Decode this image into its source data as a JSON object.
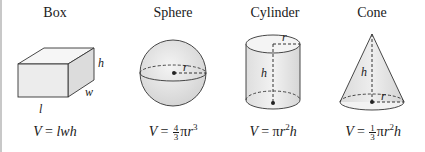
{
  "figure": {
    "shapes": [
      {
        "id": "box",
        "title": "Box",
        "labels": {
          "height": "h",
          "width": "w",
          "length": "l"
        },
        "formula": {
          "lhs": "V",
          "eq": "=",
          "rhs": "lwh"
        }
      },
      {
        "id": "sphere",
        "title": "Sphere",
        "labels": {
          "radius": "r"
        },
        "formula": {
          "lhs": "V",
          "eq": "=",
          "frac_num": "4",
          "frac_den": "3",
          "pi": "π",
          "var": "r",
          "exp": "3"
        }
      },
      {
        "id": "cylinder",
        "title": "Cylinder",
        "labels": {
          "radius": "r",
          "height": "h"
        },
        "formula": {
          "lhs": "V",
          "eq": "=",
          "pi": "π",
          "var": "r",
          "exp": "2",
          "tail": "h"
        }
      },
      {
        "id": "cone",
        "title": "Cone",
        "labels": {
          "radius": "r",
          "height": "h"
        },
        "formula": {
          "lhs": "V",
          "eq": "=",
          "frac_num": "1",
          "frac_den": "3",
          "pi": "π",
          "var": "r",
          "exp": "2",
          "tail": "h"
        }
      }
    ],
    "colors": {
      "stroke": "#333333",
      "fill_light": "#ececec",
      "fill_mid": "#dcdcdc",
      "border": "#c8c8c8"
    }
  }
}
